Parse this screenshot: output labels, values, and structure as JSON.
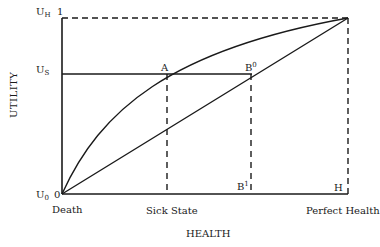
{
  "diagram": {
    "y_axis_label": "UTILITY",
    "x_axis_label": "HEALTH",
    "y_ticks": {
      "uh": {
        "base": "U",
        "sub": "H",
        "value": "1"
      },
      "us": {
        "base": "U",
        "sub": "S"
      },
      "u0": {
        "base": "U",
        "sub": "0",
        "value": "0"
      }
    },
    "x_ticks": {
      "death": "Death",
      "sick_state": "Sick State",
      "perfect_health": "Perfect Health"
    },
    "points": {
      "a": "A",
      "b0": {
        "base": "B",
        "sup": "0"
      },
      "b1": {
        "base": "B",
        "sup": "1"
      },
      "h": "H"
    }
  }
}
